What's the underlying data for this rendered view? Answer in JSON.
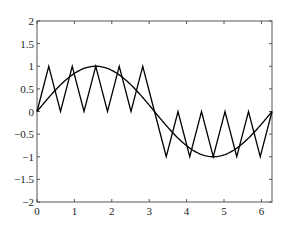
{
  "chart_data": {
    "type": "line",
    "title": "",
    "xlabel": "",
    "ylabel": "",
    "xlim": [
      0,
      6.2832
    ],
    "ylim": [
      -2,
      2
    ],
    "grid": false,
    "legend": null,
    "xticks": [
      "0",
      "1",
      "2",
      "3",
      "4",
      "5",
      "6"
    ],
    "yticks": [
      "2",
      "1.5",
      "1",
      "0.5",
      "0",
      "−0.5",
      "−1",
      "−1.5",
      "−2"
    ],
    "series": [
      {
        "name": "sin(x)",
        "description": "Smooth sine curve over one period 0 to 2π",
        "x": [
          0,
          0.7854,
          1.5708,
          2.3562,
          3.1416,
          3.927,
          4.7124,
          5.4978,
          6.2832
        ],
        "values": [
          0,
          0.707,
          1,
          0.707,
          0,
          -0.707,
          -1,
          -0.707,
          0
        ],
        "color": "#000000"
      },
      {
        "name": "sawtooth (triangle) wave",
        "description": "Triangle wave with 10 humps: 0→1→0 five times on [0,π], then 0→−1→0 five times on [π,2π]",
        "x": [
          0,
          0.3142,
          0.6283,
          0.9425,
          1.2566,
          1.5708,
          1.885,
          2.1991,
          2.5133,
          2.8274,
          3.1416,
          3.4558,
          3.7699,
          4.0841,
          4.3982,
          4.7124,
          5.0265,
          5.3407,
          5.6549,
          5.969,
          6.2832
        ],
        "values": [
          0,
          1,
          0,
          1,
          0,
          1,
          0,
          1,
          0,
          1,
          0,
          -1,
          0,
          -1,
          0,
          -1,
          0,
          -1,
          0,
          -1,
          0
        ],
        "color": "#000000"
      }
    ]
  }
}
